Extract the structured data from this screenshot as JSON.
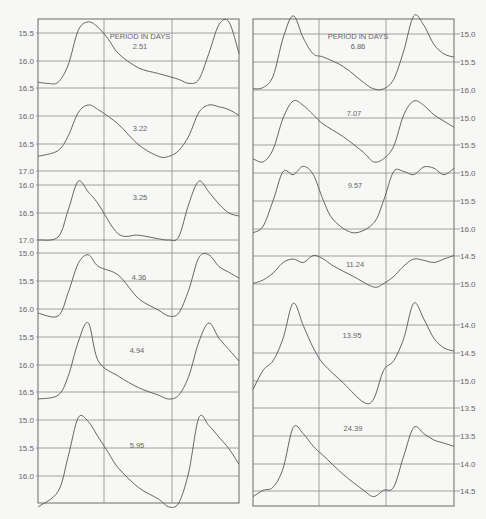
{
  "figure": {
    "header_label": "PERIOD IN DAYS",
    "colors": {
      "background": "#f7f7f5",
      "grid": "#8a8a8a",
      "frame": "#6a6a6a",
      "curve": "#555555",
      "text": "#666666"
    }
  },
  "chart_data": [
    {
      "type": "line",
      "title": "Light curves grouped by period (left column)",
      "panel": "left",
      "axis_side": "left",
      "ylabel": "magnitude (inverted, brighter up)",
      "xlabel": "phase (two cycles shown)",
      "grid": true,
      "series": [
        {
          "name": "2.51",
          "y_ticks": [
            "15.5",
            "16.0",
            "16.5"
          ],
          "ylim": [
            16.6,
            15.4
          ],
          "x": [
            0,
            0.05,
            0.1,
            0.15,
            0.2,
            0.25,
            0.3,
            0.35,
            0.4,
            0.5,
            0.6,
            0.7,
            0.75,
            0.8,
            0.85,
            0.9,
            0.95,
            1.0
          ],
          "values": [
            16.5,
            16.52,
            16.5,
            16.2,
            15.6,
            15.45,
            15.55,
            15.75,
            16.0,
            16.25,
            16.35,
            16.45,
            16.52,
            16.45,
            16.0,
            15.5,
            15.45,
            16.0
          ]
        },
        {
          "name": "3.22",
          "y_ticks": [
            "16.0",
            "16.5",
            "17.0"
          ],
          "ylim": [
            17.05,
            15.8
          ],
          "x": [
            0,
            0.1,
            0.15,
            0.2,
            0.25,
            0.3,
            0.4,
            0.5,
            0.6,
            0.65,
            0.7,
            0.75,
            0.8,
            0.85,
            0.9,
            0.95,
            1.0
          ],
          "values": [
            16.8,
            16.7,
            16.45,
            16.05,
            15.92,
            16.0,
            16.25,
            16.6,
            16.8,
            16.8,
            16.7,
            16.45,
            16.05,
            15.92,
            15.95,
            16.0,
            16.1
          ]
        },
        {
          "name": "3.25",
          "y_ticks": [
            "16.0",
            "16.5",
            "17.0"
          ],
          "ylim": [
            17.0,
            15.95
          ],
          "x": [
            0,
            0.1,
            0.15,
            0.2,
            0.25,
            0.3,
            0.4,
            0.5,
            0.6,
            0.65,
            0.7,
            0.75,
            0.8,
            0.85,
            0.9,
            0.95,
            1.0
          ],
          "values": [
            17.0,
            16.95,
            16.5,
            16.02,
            16.2,
            16.4,
            16.9,
            16.92,
            16.98,
            17.0,
            16.95,
            16.4,
            16.02,
            16.2,
            16.4,
            16.55,
            16.6
          ]
        },
        {
          "name": "4.36",
          "y_ticks": [
            "15.0",
            "15.5",
            "16.0"
          ],
          "ylim": [
            16.2,
            15.0
          ],
          "x": [
            0,
            0.1,
            0.15,
            0.2,
            0.25,
            0.3,
            0.4,
            0.5,
            0.6,
            0.65,
            0.7,
            0.75,
            0.8,
            0.85,
            0.9,
            0.95,
            1.0
          ],
          "values": [
            16.15,
            16.2,
            15.8,
            15.3,
            15.15,
            15.35,
            15.5,
            15.9,
            16.1,
            16.2,
            16.15,
            15.75,
            15.2,
            15.15,
            15.35,
            15.45,
            15.55
          ]
        },
        {
          "name": "4.94",
          "y_ticks": [
            "15.5",
            "16.0",
            "16.5"
          ],
          "ylim": [
            16.5,
            15.5
          ],
          "x": [
            0,
            0.1,
            0.15,
            0.2,
            0.25,
            0.3,
            0.4,
            0.5,
            0.6,
            0.65,
            0.7,
            0.75,
            0.8,
            0.85,
            0.9,
            0.95,
            1.0
          ],
          "values": [
            16.5,
            16.45,
            16.2,
            15.75,
            15.5,
            16.0,
            16.2,
            16.35,
            16.45,
            16.5,
            16.45,
            16.2,
            15.75,
            15.5,
            15.7,
            15.85,
            16.0
          ]
        },
        {
          "name": "5.95",
          "y_ticks": [
            "15.0",
            "15.5",
            "16.0"
          ],
          "ylim": [
            16.1,
            14.9
          ],
          "x": [
            0,
            0.1,
            0.15,
            0.2,
            0.25,
            0.3,
            0.35,
            0.4,
            0.5,
            0.6,
            0.65,
            0.7,
            0.75,
            0.8,
            0.85,
            0.9,
            0.95,
            1.0
          ],
          "values": [
            16.15,
            15.95,
            15.5,
            15.0,
            15.05,
            15.25,
            15.45,
            15.65,
            15.9,
            16.05,
            16.15,
            16.1,
            15.7,
            15.0,
            15.1,
            15.25,
            15.4,
            15.6
          ]
        }
      ]
    },
    {
      "type": "line",
      "title": "Light curves grouped by period (right column)",
      "panel": "right",
      "axis_side": "right",
      "ylabel": "magnitude (inverted, brighter up)",
      "xlabel": "phase (two cycles shown)",
      "grid": true,
      "series": [
        {
          "name": "6.86",
          "y_ticks": [
            "15.0",
            "15.5",
            "16.0"
          ],
          "ylim": [
            16.05,
            14.9
          ],
          "x": [
            0,
            0.05,
            0.1,
            0.15,
            0.2,
            0.25,
            0.3,
            0.35,
            0.45,
            0.55,
            0.6,
            0.65,
            0.7,
            0.75,
            0.8,
            0.85,
            0.9,
            0.95,
            1.0
          ],
          "values": [
            16.0,
            15.98,
            15.8,
            15.2,
            14.85,
            15.2,
            15.45,
            15.5,
            15.65,
            15.9,
            16.0,
            16.0,
            15.85,
            15.4,
            14.85,
            15.0,
            15.3,
            15.45,
            15.5
          ]
        },
        {
          "name": "7.07",
          "y_ticks": [
            "15.0",
            "15.5"
          ],
          "ylim": [
            15.8,
            14.7
          ],
          "x": [
            0,
            0.05,
            0.1,
            0.15,
            0.2,
            0.25,
            0.3,
            0.35,
            0.45,
            0.55,
            0.6,
            0.65,
            0.7,
            0.75,
            0.8,
            0.85,
            0.9,
            0.95,
            1.0
          ],
          "values": [
            15.7,
            15.75,
            15.55,
            15.05,
            14.78,
            14.85,
            15.0,
            15.15,
            15.35,
            15.6,
            15.75,
            15.7,
            15.5,
            15.0,
            14.78,
            14.85,
            15.0,
            15.1,
            15.2
          ]
        },
        {
          "name": "9.57",
          "y_ticks": [
            "15.0",
            "15.5",
            "16.0"
          ],
          "ylim": [
            16.05,
            14.95
          ],
          "x": [
            0,
            0.05,
            0.1,
            0.15,
            0.2,
            0.25,
            0.3,
            0.35,
            0.4,
            0.5,
            0.6,
            0.65,
            0.7,
            0.75,
            0.8,
            0.85,
            0.9,
            0.95,
            1.0
          ],
          "values": [
            16.0,
            15.9,
            15.5,
            15.05,
            15.1,
            14.97,
            15.1,
            15.5,
            15.8,
            16.0,
            15.85,
            15.5,
            15.05,
            15.05,
            15.1,
            14.98,
            15.0,
            15.1,
            15.0
          ]
        },
        {
          "name": "11.24",
          "y_ticks": [
            "14.5",
            "15.0"
          ],
          "ylim": [
            15.2,
            14.5
          ],
          "x": [
            0,
            0.05,
            0.1,
            0.15,
            0.2,
            0.25,
            0.3,
            0.35,
            0.4,
            0.5,
            0.6,
            0.65,
            0.7,
            0.75,
            0.8,
            0.85,
            0.9,
            0.95,
            1.0
          ],
          "values": [
            15.05,
            15.0,
            14.9,
            14.75,
            14.7,
            14.75,
            14.65,
            14.7,
            14.8,
            14.95,
            15.1,
            15.05,
            14.95,
            14.8,
            14.7,
            14.72,
            14.75,
            14.7,
            14.65
          ]
        },
        {
          "name": "13.95",
          "y_ticks": [
            "14.0",
            "14.5",
            "15.0",
            "15.5"
          ],
          "ylim": [
            15.6,
            13.8
          ],
          "x": [
            0,
            0.05,
            0.1,
            0.15,
            0.2,
            0.25,
            0.3,
            0.35,
            0.45,
            0.55,
            0.6,
            0.65,
            0.7,
            0.75,
            0.8,
            0.85,
            0.9,
            0.95,
            1.0
          ],
          "values": [
            15.2,
            14.9,
            14.75,
            14.4,
            13.85,
            14.2,
            14.55,
            14.8,
            15.1,
            15.4,
            15.35,
            14.9,
            14.75,
            14.4,
            13.85,
            14.1,
            14.4,
            14.55,
            14.6
          ]
        },
        {
          "name": "24.39",
          "y_ticks": [
            "13.5",
            "14.0",
            "14.5"
          ],
          "ylim": [
            14.6,
            13.2
          ],
          "x": [
            0,
            0.05,
            0.1,
            0.15,
            0.2,
            0.25,
            0.3,
            0.35,
            0.45,
            0.55,
            0.6,
            0.65,
            0.7,
            0.75,
            0.8,
            0.85,
            0.9,
            0.95,
            1.0
          ],
          "values": [
            14.45,
            14.35,
            14.3,
            14.0,
            13.35,
            13.45,
            13.65,
            13.8,
            14.1,
            14.35,
            14.45,
            14.35,
            14.3,
            13.8,
            13.35,
            13.45,
            13.55,
            13.6,
            13.65
          ]
        }
      ]
    }
  ],
  "left_panel": {
    "labels": [
      {
        "text": "PERIOD IN DAYS",
        "x": 140,
        "y": 39
      },
      {
        "text": "2.51",
        "x": 140,
        "y": 49
      },
      {
        "text": "3.22",
        "x": 140,
        "y": 131
      },
      {
        "text": "3.25",
        "x": 140,
        "y": 200
      },
      {
        "text": "4.36",
        "x": 139,
        "y": 280
      },
      {
        "text": "4.94",
        "x": 137,
        "y": 353
      },
      {
        "text": "5.95",
        "x": 137,
        "y": 448
      }
    ],
    "ticks": [
      {
        "y": 33,
        "label": "15.5"
      },
      {
        "y": 61,
        "label": "16.0"
      },
      {
        "y": 88,
        "label": "16.5"
      },
      {
        "y": 116,
        "label": "16.0"
      },
      {
        "y": 144,
        "label": "16.5"
      },
      {
        "y": 171,
        "label": "17.0"
      },
      {
        "y": 185,
        "label": "16.0"
      },
      {
        "y": 213,
        "label": "16.5"
      },
      {
        "y": 240,
        "label": "17.0"
      },
      {
        "y": 253,
        "label": "15.0"
      },
      {
        "y": 281,
        "label": "15.5"
      },
      {
        "y": 309,
        "label": "16.0"
      },
      {
        "y": 337,
        "label": "15.5"
      },
      {
        "y": 365,
        "label": "16.0"
      },
      {
        "y": 392,
        "label": "16.5"
      },
      {
        "y": 420,
        "label": "15.0"
      },
      {
        "y": 448,
        "label": "15.5"
      },
      {
        "y": 476,
        "label": "16.0"
      }
    ]
  },
  "right_panel": {
    "labels": [
      {
        "text": "PERIOD IN DAYS",
        "x": 358,
        "y": 39
      },
      {
        "text": "6.86",
        "x": 358,
        "y": 49
      },
      {
        "text": "7.07",
        "x": 354,
        "y": 116
      },
      {
        "text": "9.57",
        "x": 355,
        "y": 188
      },
      {
        "text": "11.24",
        "x": 355,
        "y": 267
      },
      {
        "text": "13.95",
        "x": 352,
        "y": 338
      },
      {
        "text": "24.39",
        "x": 353,
        "y": 431
      }
    ],
    "ticks": [
      {
        "y": 34,
        "label": "15.0"
      },
      {
        "y": 62,
        "label": "15.5"
      },
      {
        "y": 90,
        "label": "16.0"
      },
      {
        "y": 118,
        "label": "15.0"
      },
      {
        "y": 145,
        "label": "15.5"
      },
      {
        "y": 173,
        "label": "15.0"
      },
      {
        "y": 201,
        "label": "15.5"
      },
      {
        "y": 229,
        "label": "16.0"
      },
      {
        "y": 256,
        "label": "14.5"
      },
      {
        "y": 284,
        "label": "15.0"
      },
      {
        "y": 325,
        "label": "14.0"
      },
      {
        "y": 353,
        "label": "14.5"
      },
      {
        "y": 381,
        "label": "15.0"
      },
      {
        "y": 408,
        "label": "13.5"
      },
      {
        "y": 436,
        "label": "13.5"
      },
      {
        "y": 464,
        "label": "14.0"
      },
      {
        "y": 491,
        "label": "14.5"
      }
    ]
  }
}
